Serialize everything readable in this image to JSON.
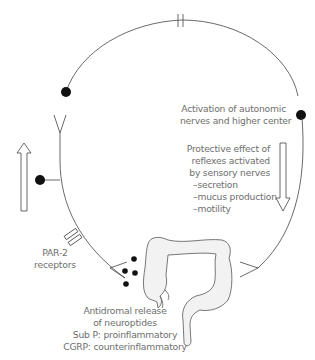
{
  "diagram": {
    "labels": {
      "activation": [
        "Activation of autonomic",
        "nerves and higher center"
      ],
      "protective": [
        "Protective effect of",
        "reflexes activated",
        "by sensory nerves"
      ],
      "effects": [
        "–secretion",
        "–mucus production",
        "–motility"
      ],
      "par2": [
        "PAR-2",
        "receptors"
      ],
      "antidromal": [
        "Antidromal release",
        "of neuroptides",
        "Sub P: proinflammatory",
        "CGRP: counterinflammatory"
      ]
    },
    "colors": {
      "line": "#444444",
      "dot": "#111111",
      "text": "#6e6e6e",
      "colon_fill": "#f2f2f2"
    },
    "icons": [
      "up-arrow-icon",
      "down-arrow-icon",
      "colon-icon",
      "synapse-icon",
      "receptor-icon",
      "neuron-dot-icon"
    ]
  }
}
